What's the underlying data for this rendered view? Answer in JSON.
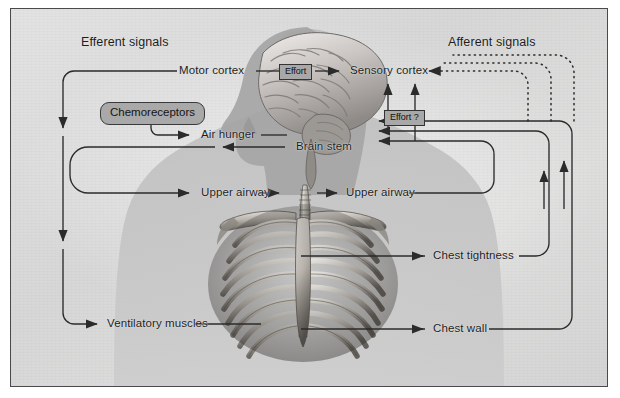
{
  "figure": {
    "headers": {
      "left": "Efferent signals",
      "right": "Afferent signals"
    },
    "boxes": {
      "chemoreceptors": "Chemoreceptors",
      "effort": "Effort",
      "effort_question": "Effort ?"
    },
    "nodes": {
      "motor_cortex": "Motor cortex",
      "sensory_cortex": "Sensory cortex",
      "air_hunger": "Air hunger",
      "brain_stem": "Brain stem",
      "upper_airway_left": "Upper airway",
      "upper_airway_right": "Upper airway",
      "chest_tightness": "Chest tightness",
      "ventilatory_muscles": "Ventilatory muscles",
      "chest_wall": "Chest wall"
    },
    "illustration": {
      "brain": "brain-illustration",
      "head": "head-silhouette",
      "trachea": "trachea-illustration",
      "ribcage": "ribcage-illustration",
      "torso": "torso-silhouette"
    },
    "colors": {
      "panel_background": "#dcdcdc",
      "frame_border": "#4a4a4a",
      "line": "#2b2b2b",
      "box_fill": "#a9a9a9",
      "text": "#1c1c1c"
    },
    "line_styles": {
      "efferent": "solid",
      "afferent_solid": "solid",
      "afferent_dashed": "dotted"
    }
  }
}
